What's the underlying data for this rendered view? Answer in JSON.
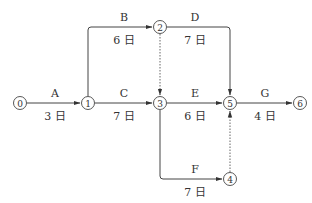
{
  "diagram": {
    "type": "activity-on-arrow network",
    "nodes": [
      {
        "id": "0",
        "label": "⓪",
        "x": 20,
        "y": 103
      },
      {
        "id": "1",
        "label": "①",
        "x": 88,
        "y": 103
      },
      {
        "id": "2",
        "label": "②",
        "x": 160,
        "y": 27
      },
      {
        "id": "3",
        "label": "③",
        "x": 160,
        "y": 103
      },
      {
        "id": "4",
        "label": "④",
        "x": 230,
        "y": 179
      },
      {
        "id": "5",
        "label": "⑤",
        "x": 230,
        "y": 103
      },
      {
        "id": "6",
        "label": "⑥",
        "x": 300,
        "y": 103
      }
    ],
    "activities": [
      {
        "name": "A",
        "from": "0",
        "to": "1",
        "duration": "3 日"
      },
      {
        "name": "B",
        "from": "1",
        "to": "2",
        "duration": "6 日"
      },
      {
        "name": "C",
        "from": "1",
        "to": "3",
        "duration": "7 日"
      },
      {
        "name": "D",
        "from": "2",
        "to": "5",
        "duration": "7 日"
      },
      {
        "name": "E",
        "from": "3",
        "to": "5",
        "duration": "6 日"
      },
      {
        "name": "F",
        "from": "3",
        "to": "4",
        "duration": "7 日"
      },
      {
        "name": "G",
        "from": "5",
        "to": "6",
        "duration": "4 日"
      }
    ],
    "dummies": [
      {
        "from": "2",
        "to": "3"
      },
      {
        "from": "4",
        "to": "5"
      }
    ]
  }
}
